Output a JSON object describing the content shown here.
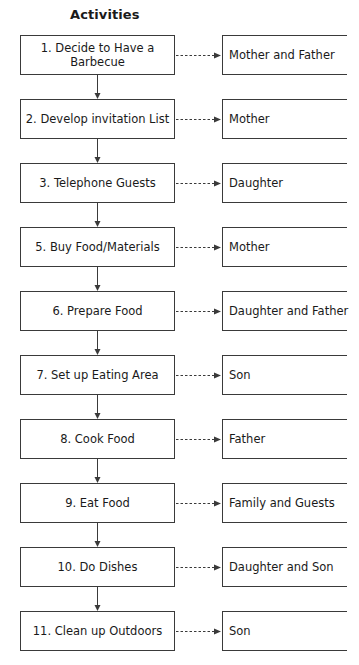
{
  "title": "Activities",
  "activities": [
    {
      "label": "1. Decide to Have a Barbecue",
      "assignee": "Mother and Father"
    },
    {
      "label": "2. Develop invitation List",
      "assignee": "Mother"
    },
    {
      "label": "3. Telephone Guests",
      "assignee": "Daughter"
    },
    {
      "label": "5. Buy Food/Materials",
      "assignee": "Mother"
    },
    {
      "label": "6. Prepare Food",
      "assignee": "Daughter and Father"
    },
    {
      "label": "7. Set up Eating Area",
      "assignee": "Son"
    },
    {
      "label": "8. Cook Food",
      "assignee": "Father"
    },
    {
      "label": "9. Eat Food",
      "assignee": "Family and Guests"
    },
    {
      "label": "10. Do Dishes",
      "assignee": "Daughter and Son"
    },
    {
      "label": "11. Clean up Outdoors",
      "assignee": "Son"
    }
  ],
  "style": {
    "line_color": "#3a3a3a",
    "text_color": "#1a1a1a",
    "background": "#ffffff"
  }
}
